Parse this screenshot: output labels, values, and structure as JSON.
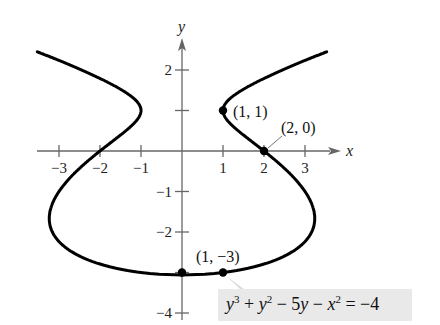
{
  "chart_data": {
    "type": "line",
    "title": "",
    "equation": "y^3 + y^2 - 5y - x^2 = -4",
    "equation_parts": {
      "y3": "y",
      "sup3": "3",
      "plus1": " + ",
      "y2": "y",
      "sup2": "2",
      "minus5": " − 5",
      "y1": "y",
      "minus": " − ",
      "x": "x",
      "supx": "2",
      "rhs": " = −4"
    },
    "xlabel": "x",
    "ylabel": "y",
    "xlim": [
      -3.5,
      3.8
    ],
    "ylim": [
      -4.3,
      2.9
    ],
    "x_ticks": [
      -3,
      -2,
      -1,
      1,
      2,
      3
    ],
    "x_tick_labels": [
      "−3",
      "−2",
      "−1",
      "1",
      "2",
      "3"
    ],
    "y_ticks": [
      2,
      1,
      -1,
      -2,
      -3,
      -4
    ],
    "y_tick_labels": [
      "2",
      "",
      "−1",
      "−2",
      "",
      "−4"
    ],
    "grid": false,
    "curve": {
      "description": "x^2 = y^3 + y^2 - 5y + 4",
      "y_max": 2.45,
      "y_min": -3.06
    },
    "points": [
      {
        "x": 1,
        "y": 1,
        "label": "(1, 1)"
      },
      {
        "x": 2,
        "y": 0,
        "label": "(2, 0)"
      },
      {
        "x": 0,
        "y": -3,
        "label": ""
      },
      {
        "x": 1,
        "y": -3,
        "label": "(1, −3)"
      }
    ],
    "colors": {
      "curve": "#000000",
      "axis": "#666666",
      "label_bg": "#e9e9e9"
    }
  }
}
